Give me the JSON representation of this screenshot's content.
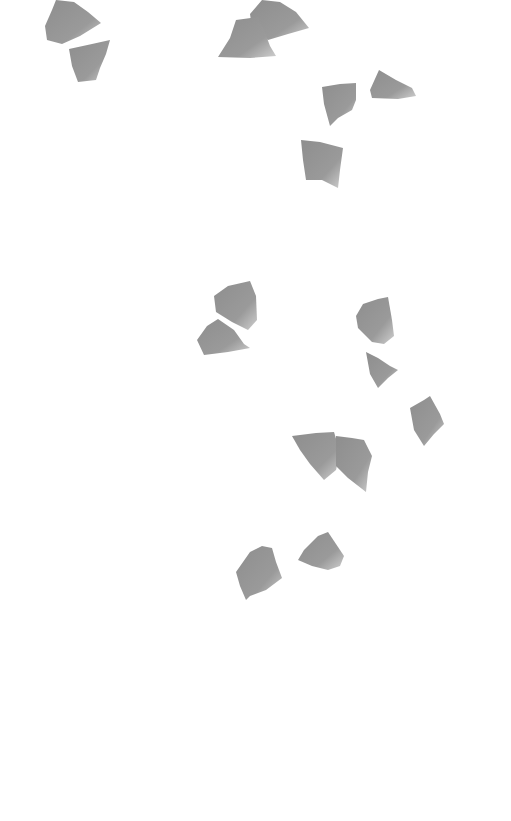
{
  "scene": {
    "width": 511,
    "height": 821,
    "background": "#ffffff",
    "petal_color_dark": "#8f8f8f",
    "petal_color_light": "#c4c4c4",
    "petals": [
      {
        "id": "petal-1",
        "points": "56,0 74,2 88,12 101,23 80,36 62,44 47,40 45,26 52,10"
      },
      {
        "id": "petal-2",
        "points": "69,49 92,44 110,40 106,54 100,68 96,80 78,82 72,66"
      },
      {
        "id": "petal-3",
        "points": "262,0 280,2 296,12 309,28 288,34 268,40 252,28 250,14"
      },
      {
        "id": "petal-4",
        "points": "236,20 258,17 264,30 270,46 276,56 250,58 218,57 230,38"
      },
      {
        "id": "petal-5",
        "points": "322,87 340,84 356,83 356,100 352,110 338,118 330,126 324,104"
      },
      {
        "id": "petal-6",
        "points": "379,70 396,80 412,88 416,96 398,99 372,98 370,90"
      },
      {
        "id": "petal-7",
        "points": "301,140 320,142 343,148 340,170 338,188 322,180 306,180 303,160"
      },
      {
        "id": "petal-8",
        "points": "214,296 228,286 250,281 256,296 257,320 248,330 232,322 216,312"
      },
      {
        "id": "petal-9",
        "points": "207,326 218,319 234,330 244,344 250,348 228,352 204,355 197,340"
      },
      {
        "id": "petal-10",
        "points": "363,304 378,299 388,297 392,320 394,336 384,344 372,342 358,328 356,316"
      },
      {
        "id": "petal-11",
        "points": "366,352 378,358 390,366 398,370 388,378 378,388 370,374"
      },
      {
        "id": "petal-12",
        "points": "410,408 424,400 430,396 440,414 444,424 434,434 424,446 414,430"
      },
      {
        "id": "petal-13",
        "points": "292,436 316,433 334,432 340,452 336,470 324,480 310,464 300,450"
      },
      {
        "id": "petal-14",
        "points": "336,436 352,438 364,440 370,452 372,456 368,472 366,492 348,478 336,466"
      },
      {
        "id": "petal-15",
        "points": "250,552 262,546 272,548 276,562 282,578 266,590 250,596 246,600 240,586 236,572"
      },
      {
        "id": "petal-16",
        "points": "318,536 328,532 336,544 344,556 340,566 328,570 312,566 298,560 304,550"
      }
    ]
  }
}
